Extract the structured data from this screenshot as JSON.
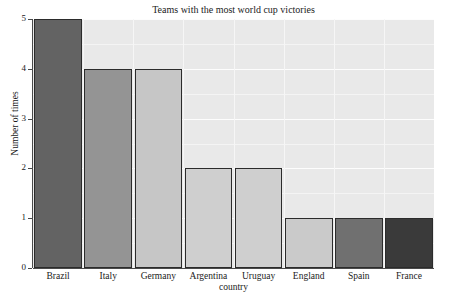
{
  "chart_data": {
    "type": "bar",
    "title": "Teams with the most world cup victories",
    "xlabel": "country",
    "ylabel": "Number of times",
    "categories": [
      "Brazil",
      "Italy",
      "Germany",
      "Argentina",
      "Uruguay",
      "England",
      "Spain",
      "France"
    ],
    "values": [
      5,
      4,
      4,
      2,
      2,
      1,
      1,
      1
    ],
    "bar_colors": [
      "#636363",
      "#949494",
      "#c6c6c6",
      "#cfcfcf",
      "#cfcfcf",
      "#cacaca",
      "#707070",
      "#3a3a3a"
    ],
    "bar_edge_color": "#2b2b2b",
    "ylim": [
      0,
      5
    ],
    "yticks": [
      0,
      1,
      2,
      3,
      4,
      5
    ],
    "ytick_labels": [
      "0",
      "1",
      "2",
      "3",
      "4",
      "5"
    ],
    "grid": true,
    "grid_color": "#ffffff",
    "panel_color": "#e9e9e9",
    "legend": "none",
    "figure_background": "#ffffff"
  }
}
